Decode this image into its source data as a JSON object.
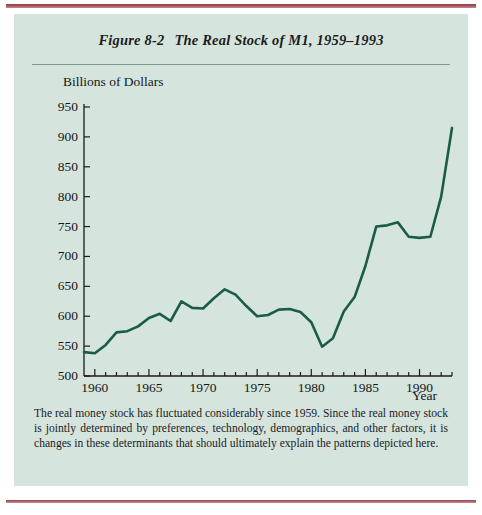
{
  "figure": {
    "number": "Figure 8-2",
    "title": "The Real Stock of M1, 1959–1993",
    "caption": "The real money stock has fluctuated considerably since 1959. Since the real money stock is jointly determined by preferences, technology, demographics, and other factors, it is changes in these determinants that should ultimately explain the patterns depicted here.",
    "background_color": "#d5e5de",
    "rule_color": "#a8575e"
  },
  "chart_data": {
    "type": "line",
    "title": "The Real Stock of M1, 1959–1993",
    "xlabel": "Year",
    "ylabel": "Billions of Dollars",
    "xlim": [
      1959,
      1993
    ],
    "ylim": [
      500,
      950
    ],
    "ytick_step": 50,
    "yticks": [
      500,
      550,
      600,
      650,
      700,
      750,
      800,
      850,
      900,
      950
    ],
    "xticks_major": [
      1960,
      1965,
      1970,
      1975,
      1980,
      1985,
      1990
    ],
    "xticks_minor_every": 1,
    "grid": false,
    "legend": "none",
    "line_color": "#1a5c48",
    "line_width": 2.6,
    "x": [
      1959,
      1960,
      1961,
      1962,
      1963,
      1964,
      1965,
      1966,
      1967,
      1968,
      1969,
      1970,
      1971,
      1972,
      1973,
      1974,
      1975,
      1976,
      1977,
      1978,
      1979,
      1980,
      1981,
      1982,
      1983,
      1984,
      1985,
      1986,
      1987,
      1988,
      1989,
      1990,
      1991,
      1992,
      1993
    ],
    "values": [
      540,
      538,
      552,
      573,
      575,
      583,
      597,
      604,
      592,
      625,
      614,
      613,
      630,
      645,
      636,
      617,
      600,
      602,
      611,
      612,
      607,
      590,
      549,
      563,
      608,
      632,
      684,
      750,
      752,
      757,
      733,
      731,
      733,
      800,
      915
    ],
    "series": [
      {
        "name": "Real Stock of M1",
        "values": [
          540,
          538,
          552,
          573,
          575,
          583,
          597,
          604,
          592,
          625,
          614,
          613,
          630,
          645,
          636,
          617,
          600,
          602,
          611,
          612,
          607,
          590,
          549,
          563,
          608,
          632,
          684,
          750,
          752,
          757,
          733,
          731,
          733,
          800,
          915
        ]
      }
    ]
  }
}
